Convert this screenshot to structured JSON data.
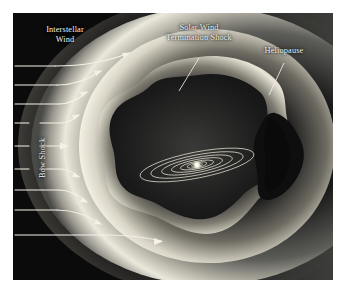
{
  "figure": {
    "background_color": "#0b0b0b",
    "glow_color": "#f5f3ea",
    "margin_color": "#ffffff",
    "labels": {
      "interstellar_wind_line1": "Interstellar",
      "interstellar_wind_line2": "Wind",
      "solar_wind_line1": "Solar Wind",
      "solar_wind_line2": "Termination Shock",
      "heliopause": "Heliopause",
      "bow_shock": "Bow Shock"
    },
    "features": [
      {
        "name": "bow-shock",
        "label": "Bow Shock"
      },
      {
        "name": "heliopause",
        "label": "Heliopause"
      },
      {
        "name": "termination-shock",
        "label": "Solar Wind Termination Shock"
      },
      {
        "name": "interstellar-wind",
        "label": "Interstellar Wind"
      },
      {
        "name": "heliotail",
        "label": ""
      },
      {
        "name": "planetary-orbits",
        "label": ""
      },
      {
        "name": "sun",
        "label": ""
      }
    ],
    "inflow_arrow_count": 9
  }
}
